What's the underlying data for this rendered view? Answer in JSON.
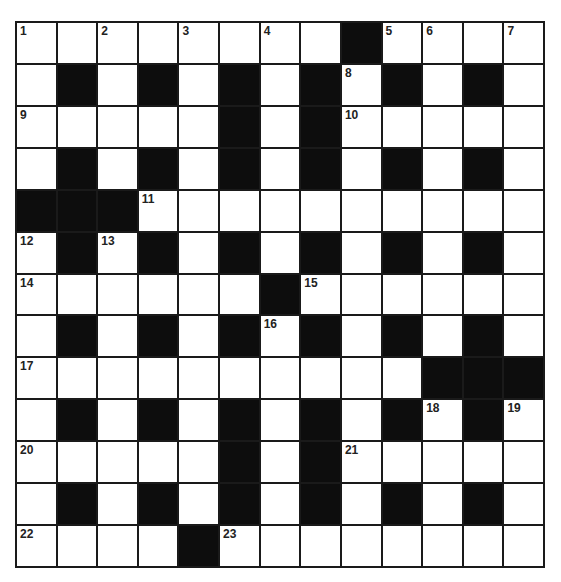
{
  "puzzle": {
    "rows": 13,
    "cols": 13,
    "colors": {
      "block": "#0d0d0d",
      "cell": "#ffffff",
      "line": "#1a1a1a"
    },
    "grid": [
      "WWWWWWWWBWWWW",
      "WBWBWBWBWBWBW",
      "WWWWWBWBWWWWW",
      "WBWBWBWBWBWBW",
      "BBBWWWWWWWWWW",
      "WBWBWBWBWBWBW",
      "WWWWWWBWWWWWW",
      "WBWBWBWBWBWBW",
      "WWWWWWWWWWBBB",
      "WBWBWBWBWBWBW",
      "WWWWWBWBWWWWW",
      "WBWBWBWBWBWBW",
      "WWWWBWWWWWWWW"
    ],
    "numbers": [
      {
        "r": 0,
        "c": 0,
        "n": "1"
      },
      {
        "r": 0,
        "c": 2,
        "n": "2"
      },
      {
        "r": 0,
        "c": 4,
        "n": "3"
      },
      {
        "r": 0,
        "c": 6,
        "n": "4"
      },
      {
        "r": 0,
        "c": 9,
        "n": "5"
      },
      {
        "r": 0,
        "c": 10,
        "n": "6"
      },
      {
        "r": 0,
        "c": 12,
        "n": "7"
      },
      {
        "r": 1,
        "c": 8,
        "n": "8"
      },
      {
        "r": 2,
        "c": 0,
        "n": "9"
      },
      {
        "r": 2,
        "c": 8,
        "n": "10"
      },
      {
        "r": 4,
        "c": 3,
        "n": "11"
      },
      {
        "r": 5,
        "c": 0,
        "n": "12"
      },
      {
        "r": 5,
        "c": 2,
        "n": "13"
      },
      {
        "r": 6,
        "c": 0,
        "n": "14"
      },
      {
        "r": 6,
        "c": 7,
        "n": "15"
      },
      {
        "r": 7,
        "c": 6,
        "n": "16"
      },
      {
        "r": 8,
        "c": 0,
        "n": "17"
      },
      {
        "r": 9,
        "c": 10,
        "n": "18"
      },
      {
        "r": 9,
        "c": 12,
        "n": "19"
      },
      {
        "r": 10,
        "c": 0,
        "n": "20"
      },
      {
        "r": 10,
        "c": 8,
        "n": "21"
      },
      {
        "r": 12,
        "c": 0,
        "n": "22"
      },
      {
        "r": 12,
        "c": 5,
        "n": "23"
      }
    ]
  }
}
